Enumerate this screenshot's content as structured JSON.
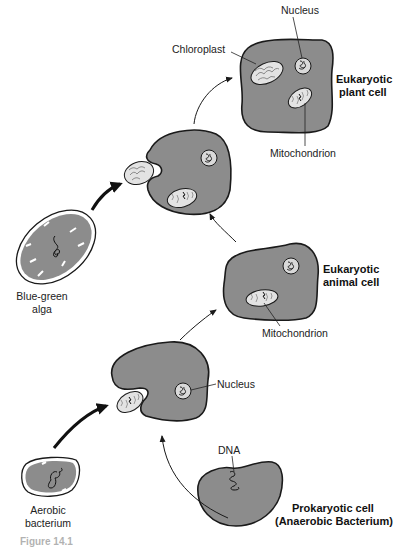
{
  "figure": {
    "caption_fragment": "Figure 14.1",
    "colors": {
      "cytoplasm": "#8c8c8c",
      "outline": "#1a1a1a",
      "organelle_fill": "#d9d9d9",
      "text": "#222222",
      "background": "#ffffff"
    }
  },
  "cells": {
    "plant": {
      "title_line1": "Eukaryotic",
      "title_line2": "plant cell"
    },
    "animal": {
      "title_line1": "Eukaryotic",
      "title_line2": "animal cell"
    },
    "prokaryote": {
      "title_line1": "Prokaryotic cell",
      "title_line2": "(Anaerobic Bacterium)"
    },
    "alga": {
      "title_line1": "Blue-green",
      "title_line2": "alga"
    },
    "aerobe": {
      "title_line1": "Aerobic",
      "title_line2": "bacterium"
    }
  },
  "labels": {
    "plant_nucleus": "Nucleus",
    "plant_chloroplast": "Chloroplast",
    "plant_mitochondrion": "Mitochondrion",
    "animal_mitochondrion": "Mitochondrion",
    "host_nucleus": "Nucleus",
    "prokaryote_dna": "DNA"
  },
  "arrows": [
    {
      "from": "prokaryote",
      "to": "host-engulfing-aerobe",
      "style": "thin"
    },
    {
      "from": "aerobe",
      "to": "host-engulfing-aerobe",
      "style": "bold"
    },
    {
      "from": "host-engulfing-aerobe",
      "to": "animal",
      "style": "thin"
    },
    {
      "from": "animal",
      "to": "host-engulfing-alga",
      "style": "thin"
    },
    {
      "from": "alga",
      "to": "host-engulfing-alga",
      "style": "bold"
    },
    {
      "from": "host-engulfing-alga",
      "to": "plant",
      "style": "thin"
    }
  ]
}
